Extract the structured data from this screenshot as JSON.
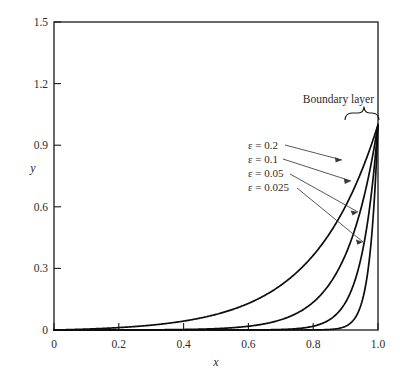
{
  "figure": {
    "background_color": "#ffffff",
    "line_color": "#0d0d0d",
    "text_color": "#2b2b2b"
  },
  "chart_data": {
    "type": "line",
    "title": "",
    "xlabel": "x",
    "ylabel": "y",
    "xlim": [
      0,
      1.0
    ],
    "ylim": [
      0,
      1.5
    ],
    "grid": false,
    "legend_position": "inside-right",
    "x_ticks": [
      "0",
      "0.2",
      "0.4",
      "0.6",
      "0.8",
      "1.0"
    ],
    "x_tick_values": [
      0,
      0.2,
      0.4,
      0.6,
      0.8,
      1.0
    ],
    "y_ticks": [
      "0",
      "0.3",
      "0.6",
      "0.9",
      "1.2",
      "1.5"
    ],
    "y_tick_values": [
      0,
      0.3,
      0.6,
      0.9,
      1.2,
      1.5
    ],
    "annotations": [
      {
        "name": "boundary-layer",
        "text": "Boundary layer",
        "x": 0.935,
        "y": 1.18
      }
    ],
    "series": [
      {
        "name": "eps-0.2",
        "label": "ε = 0.2",
        "epsilon": 0.2,
        "x": [
          0,
          0.05,
          0.1,
          0.15,
          0.2,
          0.25,
          0.3,
          0.35,
          0.4,
          0.45,
          0.5,
          0.55,
          0.6,
          0.65,
          0.7,
          0.75,
          0.8,
          0.85,
          0.9,
          0.95,
          1.0
        ],
        "values": [
          0,
          0.002,
          0.004,
          0.008,
          0.012,
          0.018,
          0.025,
          0.034,
          0.046,
          0.062,
          0.082,
          0.108,
          0.142,
          0.185,
          0.241,
          0.313,
          0.406,
          0.525,
          0.679,
          0.876,
          1.0
        ]
      },
      {
        "name": "eps-0.1",
        "label": "ε = 0.1",
        "epsilon": 0.1,
        "x": [
          0,
          0.05,
          0.1,
          0.2,
          0.3,
          0.4,
          0.5,
          0.55,
          0.6,
          0.65,
          0.7,
          0.75,
          0.8,
          0.85,
          0.9,
          0.95,
          1.0
        ],
        "values": [
          0,
          0.0,
          0.0001,
          0.0002,
          0.0005,
          0.0015,
          0.0041,
          0.0067,
          0.0111,
          0.0183,
          0.0302,
          0.0498,
          0.0821,
          0.1353,
          0.2231,
          0.3679,
          1.0
        ]
      },
      {
        "name": "eps-0.05",
        "label": "ε = 0.05",
        "epsilon": 0.05,
        "x": [
          0,
          0.1,
          0.2,
          0.3,
          0.4,
          0.5,
          0.6,
          0.7,
          0.75,
          0.8,
          0.85,
          0.9,
          0.95,
          0.975,
          1.0
        ],
        "values": [
          0,
          0,
          0,
          0,
          0,
          5e-05,
          0.0003,
          0.0025,
          0.0067,
          0.0183,
          0.0498,
          0.1353,
          0.3679,
          0.6065,
          1.0
        ]
      },
      {
        "name": "eps-0.025",
        "label": "ε = 0.025",
        "epsilon": 0.025,
        "x": [
          0,
          0.2,
          0.4,
          0.6,
          0.7,
          0.8,
          0.85,
          0.9,
          0.925,
          0.95,
          0.975,
          0.99,
          1.0
        ],
        "values": [
          0,
          0,
          0,
          0,
          0,
          0.0003,
          0.0025,
          0.0183,
          0.0498,
          0.1353,
          0.3679,
          0.6703,
          1.0
        ]
      }
    ]
  }
}
